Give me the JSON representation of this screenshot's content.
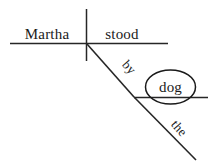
{
  "diagram": {
    "type": "reed-kellogg-sentence-diagram",
    "sentence": "Martha stood by the dog",
    "ink_color": "#262626",
    "background_color": "#ffffff",
    "labels": {
      "subject": "Martha",
      "verb": "stood",
      "preposition": "by",
      "object_of_preposition": "dog",
      "article": "the"
    },
    "strokes": {
      "baseline": {
        "x1": 10,
        "y1": 43.5,
        "x2": 168,
        "y2": 43.5
      },
      "subject_verb_divider": {
        "x1": 86.5,
        "y1": 9,
        "x2": 86.5,
        "y2": 61
      },
      "preposition_slant": {
        "x1": 87,
        "y1": 44,
        "x2": 134,
        "y2": 97
      },
      "object_baseline": {
        "x1": 134,
        "y1": 97.5,
        "x2": 208,
        "y2": 97.5
      },
      "article_slant": {
        "x1": 134,
        "y1": 97,
        "x2": 196,
        "y2": 160
      },
      "object_circle": {
        "cx": 170.5,
        "cy": 87,
        "rx": 25,
        "ry": 17
      }
    },
    "label_positions": {
      "subject": {
        "x": 47,
        "y": 39,
        "rotation": 0
      },
      "verb": {
        "x": 122,
        "y": 39,
        "rotation": 0
      },
      "preposition": {
        "x": 126,
        "y": 70,
        "rotation": 49
      },
      "object_of_preposition": {
        "x": 170.5,
        "y": 92,
        "rotation": 0
      },
      "article": {
        "x": 176,
        "y": 131,
        "rotation": 49
      }
    }
  }
}
